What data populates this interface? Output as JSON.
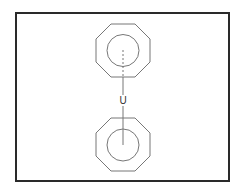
{
  "diagram": {
    "molecule": "uranocene",
    "central_atom": {
      "label": "U"
    },
    "rings": [
      {
        "name": "top-cyclooctatetraene-ring",
        "shape": "octagon",
        "aromatic_circle": true,
        "bond_to_center": "dashed"
      },
      {
        "name": "bottom-cyclooctatetraene-ring",
        "shape": "octagon",
        "aromatic_circle": true,
        "bond_to_center": "solid"
      }
    ],
    "colors": {
      "border": "#2a2a2a",
      "lines": "#777777",
      "background": "#ffffff"
    }
  }
}
